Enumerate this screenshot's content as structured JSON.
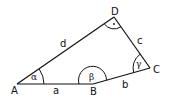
{
  "diagram": {
    "colors": {
      "stroke": "#111111",
      "background": "#ffffff"
    },
    "vertices": [
      {
        "id": "A",
        "label": "A"
      },
      {
        "id": "B",
        "label": "B"
      },
      {
        "id": "C",
        "label": "C"
      },
      {
        "id": "D",
        "label": "D"
      }
    ],
    "sides": [
      {
        "id": "a",
        "label": "a",
        "from": "A",
        "to": "B"
      },
      {
        "id": "b",
        "label": "b",
        "from": "B",
        "to": "C"
      },
      {
        "id": "c",
        "label": "c",
        "from": "C",
        "to": "D"
      },
      {
        "id": "d",
        "label": "d",
        "from": "D",
        "to": "A"
      }
    ],
    "angles": [
      {
        "id": "alpha",
        "label": "α",
        "vertex": "A"
      },
      {
        "id": "beta",
        "label": "β",
        "vertex": "B"
      },
      {
        "id": "gamma",
        "label": "γ",
        "vertex": "C"
      },
      {
        "id": "delta",
        "label": "·",
        "vertex": "D",
        "right_angle": true
      }
    ]
  }
}
